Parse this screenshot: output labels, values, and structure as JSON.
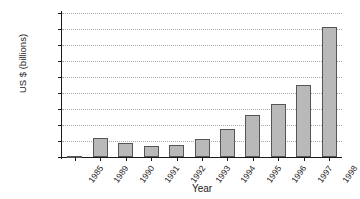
{
  "chart_data": {
    "type": "bar",
    "title": "",
    "xlabel": "Year",
    "ylabel": "US $ (billions)",
    "categories": [
      "1985",
      "1989",
      "1990",
      "1991",
      "1992",
      "1993",
      "1994",
      "1995",
      "1996",
      "1997",
      "1998"
    ],
    "values": [
      10,
      235,
      180,
      140,
      145,
      225,
      345,
      520,
      660,
      900,
      1620
    ],
    "ylim": [
      0,
      1800
    ],
    "yticks": [
      0,
      200,
      400,
      600,
      800,
      1000,
      1200,
      1400,
      1600,
      1800
    ],
    "ytick_labels": [
      "0",
      "200",
      "400",
      "600",
      "800",
      "1000",
      "1200",
      "1400",
      "1600",
      "1800"
    ],
    "grid": true,
    "grid_style": "dotted",
    "legend": null,
    "bar_color": "#b9b9b9",
    "bar_border_color": "#555555",
    "axis_color": "#1a1a1a",
    "grid_color": "#aaaaaa",
    "background": "#ffffff"
  }
}
